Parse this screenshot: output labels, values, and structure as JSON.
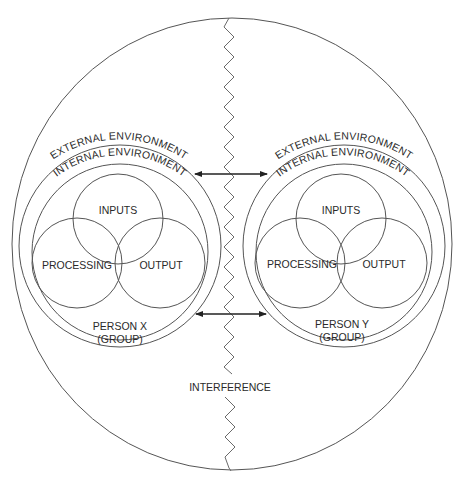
{
  "diagram": {
    "title": "",
    "persons": [
      {
        "id": "x",
        "external_label": "EXTERNAL ENVIRONMENT",
        "internal_label": "INTERNAL ENVIRONMENT",
        "inputs_label": "INPUTS",
        "processing_label": "PROCESSING",
        "output_label": "OUTPUT",
        "name_line1": "PERSON X",
        "name_line2": "(GROUP)"
      },
      {
        "id": "y",
        "external_label": "EXTERNAL ENVIRONMENT",
        "internal_label": "INTERNAL ENVIRONMENT",
        "inputs_label": "INPUTS",
        "processing_label": "PROCESSING",
        "output_label": "OUTPUT",
        "name_line1": "PERSON Y",
        "name_line2": "(GROUP)"
      }
    ],
    "interference_label": "INTERFERENCE",
    "arrows": [
      {
        "name": "upper-bidirectional-arrow",
        "from": "person-x",
        "to": "person-y"
      },
      {
        "name": "lower-bidirectional-arrow",
        "from": "person-x",
        "to": "person-y"
      }
    ],
    "colors": {
      "stroke": "#555555",
      "arrow": "#222222",
      "text": "#2a2a2a",
      "background": "#ffffff"
    }
  }
}
